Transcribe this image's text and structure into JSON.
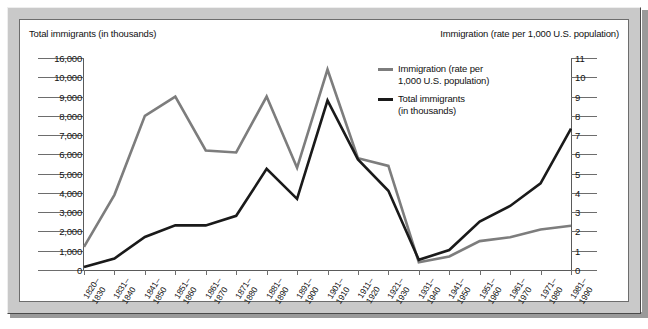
{
  "header": {
    "left_axis_title": "Total immigrants (in thousands)",
    "right_axis_title": "Immigration (rate per 1,000 U.S. population)"
  },
  "legend": {
    "position": "inside-top-right",
    "items": [
      {
        "label": "Immigration (rate per\n1,000 U.S. population)",
        "color": "#7d7d7d",
        "name": "rate"
      },
      {
        "label": "Total immigrants\n(in thousands)",
        "color": "#1a1a1a",
        "name": "total"
      }
    ]
  },
  "chart_data": {
    "type": "line",
    "title": "",
    "subtitle": "",
    "xlabel": "",
    "ylabel": "Total immigrants (in thousands)",
    "y2label": "Immigration (rate per 1,000 U.S. population)",
    "grid": false,
    "legend_position": "inside-top-right",
    "note": "Left axis is non-linear: evenly spaced rows 0,1000..10000 then a jump to 16000 at the top.",
    "x": [
      "1820–\n1830",
      "1831–\n1840",
      "1841–\n1850",
      "1851–\n1860",
      "1861–\n1870",
      "1871–\n1880",
      "1881–\n1890",
      "1891–\n1900",
      "1901–\n1910",
      "1911–\n1920",
      "1921–\n1930",
      "1931–\n1940",
      "1941–\n1950",
      "1951–\n1960",
      "1961–\n1970",
      "1971–\n1980",
      "1981–\n1990"
    ],
    "categories": [
      "1820-1830",
      "1831-1840",
      "1841-1850",
      "1851-1860",
      "1861-1870",
      "1871-1880",
      "1881-1890",
      "1891-1900",
      "1901-1910",
      "1911-1920",
      "1921-1930",
      "1931-1940",
      "1941-1950",
      "1951-1960",
      "1961-1970",
      "1971-1980",
      "1981-1990"
    ],
    "yticks_left": [
      "0",
      "1,000",
      "2,000",
      "3,000",
      "4,000",
      "5,000",
      "6,000",
      "7,000",
      "8,000",
      "9,000",
      "10,000",
      "16,000"
    ],
    "yticks_right": [
      "0",
      "1",
      "2",
      "3",
      "4",
      "5",
      "6",
      "7",
      "8",
      "9",
      "10",
      "11"
    ],
    "ylim_left": [
      0,
      16000
    ],
    "ylim_right": [
      0,
      11
    ],
    "series": [
      {
        "name": "Immigration (rate per 1,000 U.S. population)",
        "axis": "right",
        "color": "#7d7d7d",
        "values": [
          1.2,
          3.9,
          8.0,
          9.0,
          6.2,
          6.1,
          9.0,
          5.3,
          10.4,
          5.8,
          5.4,
          0.4,
          0.7,
          1.5,
          1.7,
          2.1,
          2.3
        ]
      },
      {
        "name": "Total immigrants (in thousands)",
        "axis": "left",
        "color": "#1a1a1a",
        "values": [
          152,
          600,
          1713,
          2314,
          2315,
          2812,
          5247,
          3688,
          8795,
          5736,
          4107,
          528,
          1035,
          2515,
          3322,
          4493,
          7338
        ]
      }
    ]
  }
}
